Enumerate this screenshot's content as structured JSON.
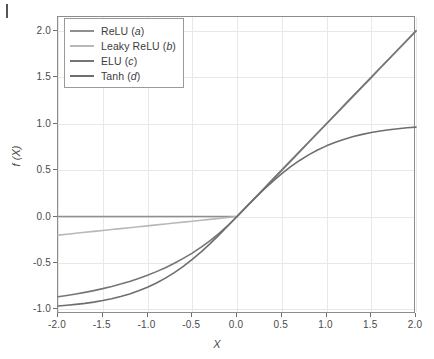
{
  "chart_data": {
    "type": "line",
    "title": "",
    "xlabel": "X",
    "ylabel": "f (X)",
    "xlim": [
      -2.0,
      2.0
    ],
    "ylim": [
      -1.05,
      2.15
    ],
    "grid": true,
    "legend_position": "upper-left",
    "xticks": [
      "-2.0",
      "-1.5",
      "-1.0",
      "-0.5",
      "0.0",
      "0.5",
      "1.0",
      "1.5",
      "2.0"
    ],
    "xtick_values": [
      -2.0,
      -1.5,
      -1.0,
      -0.5,
      0.0,
      0.5,
      1.0,
      1.5,
      2.0
    ],
    "yticks": [
      "2.0",
      "1.5",
      "1.0",
      "0.5",
      "0.0",
      "-0.5",
      "-1.0"
    ],
    "ytick_values": [
      2.0,
      1.5,
      1.0,
      0.5,
      0.0,
      -0.5,
      -1.0
    ],
    "x": [
      -2.0,
      -1.9,
      -1.8,
      -1.7,
      -1.6,
      -1.5,
      -1.4,
      -1.3,
      -1.2,
      -1.1,
      -1.0,
      -0.9,
      -0.8,
      -0.7,
      -0.6,
      -0.5,
      -0.4,
      -0.3,
      -0.2,
      -0.1,
      0.0,
      0.1,
      0.2,
      0.3,
      0.4,
      0.5,
      0.6,
      0.7,
      0.8,
      0.9,
      1.0,
      1.1,
      1.2,
      1.3,
      1.4,
      1.5,
      1.6,
      1.7,
      1.8,
      1.9,
      2.0
    ],
    "series": [
      {
        "name": "ReLU (a)",
        "label_main": "ReLU",
        "label_paren": "a",
        "color": "#8f8f8f",
        "values": [
          0.0,
          0.0,
          0.0,
          0.0,
          0.0,
          0.0,
          0.0,
          0.0,
          0.0,
          0.0,
          0.0,
          0.0,
          0.0,
          0.0,
          0.0,
          0.0,
          0.0,
          0.0,
          0.0,
          0.0,
          0.0,
          0.1,
          0.2,
          0.3,
          0.4,
          0.5,
          0.6,
          0.7,
          0.8,
          0.9,
          1.0,
          1.1,
          1.2,
          1.3,
          1.4,
          1.5,
          1.6,
          1.7,
          1.8,
          1.9,
          2.0
        ]
      },
      {
        "name": "Leaky ReLU (b)",
        "label_main": "Leaky ReLU",
        "label_paren": "b",
        "color": "#b8b8b8",
        "values": [
          -0.2,
          -0.19,
          -0.18,
          -0.17,
          -0.16,
          -0.15,
          -0.14,
          -0.13,
          -0.12,
          -0.11,
          -0.1,
          -0.09,
          -0.08,
          -0.07,
          -0.06,
          -0.05,
          -0.04,
          -0.03,
          -0.02,
          -0.01,
          0.0,
          0.1,
          0.2,
          0.3,
          0.4,
          0.5,
          0.6,
          0.7,
          0.8,
          0.9,
          1.0,
          1.1,
          1.2,
          1.3,
          1.4,
          1.5,
          1.6,
          1.7,
          1.8,
          1.9,
          2.0
        ]
      },
      {
        "name": "ELU (c)",
        "label_main": "ELU",
        "label_paren": "c",
        "color": "#757575",
        "values": [
          -0.8647,
          -0.8504,
          -0.8347,
          -0.8173,
          -0.7981,
          -0.7769,
          -0.7534,
          -0.7275,
          -0.6988,
          -0.6671,
          -0.6321,
          -0.5934,
          -0.5507,
          -0.5034,
          -0.4512,
          -0.3935,
          -0.3297,
          -0.2592,
          -0.1813,
          -0.0952,
          0.0,
          0.1,
          0.2,
          0.3,
          0.4,
          0.5,
          0.6,
          0.7,
          0.8,
          0.9,
          1.0,
          1.1,
          1.2,
          1.3,
          1.4,
          1.5,
          1.6,
          1.7,
          1.8,
          1.9,
          2.0
        ]
      },
      {
        "name": "Tanh (d)",
        "label_main": "Tanh",
        "label_paren": "d",
        "color": "#6e6e6e",
        "values": [
          -0.964,
          -0.9562,
          -0.9468,
          -0.9354,
          -0.9217,
          -0.9051,
          -0.8854,
          -0.8617,
          -0.8337,
          -0.8005,
          -0.7616,
          -0.7163,
          -0.664,
          -0.6044,
          -0.537,
          -0.4621,
          -0.3799,
          -0.2913,
          -0.1974,
          -0.0997,
          0.0,
          0.0997,
          0.1974,
          0.2913,
          0.3799,
          0.4621,
          0.537,
          0.6044,
          0.664,
          0.7163,
          0.7616,
          0.8005,
          0.8337,
          0.8617,
          0.8854,
          0.9051,
          0.9217,
          0.9354,
          0.9468,
          0.9562,
          0.964
        ]
      }
    ]
  },
  "style": {
    "frame_color": "#8c8c8c",
    "grid_color": "#e8e8e8",
    "text_color": "#4a4a4a",
    "background": "#ffffff"
  }
}
